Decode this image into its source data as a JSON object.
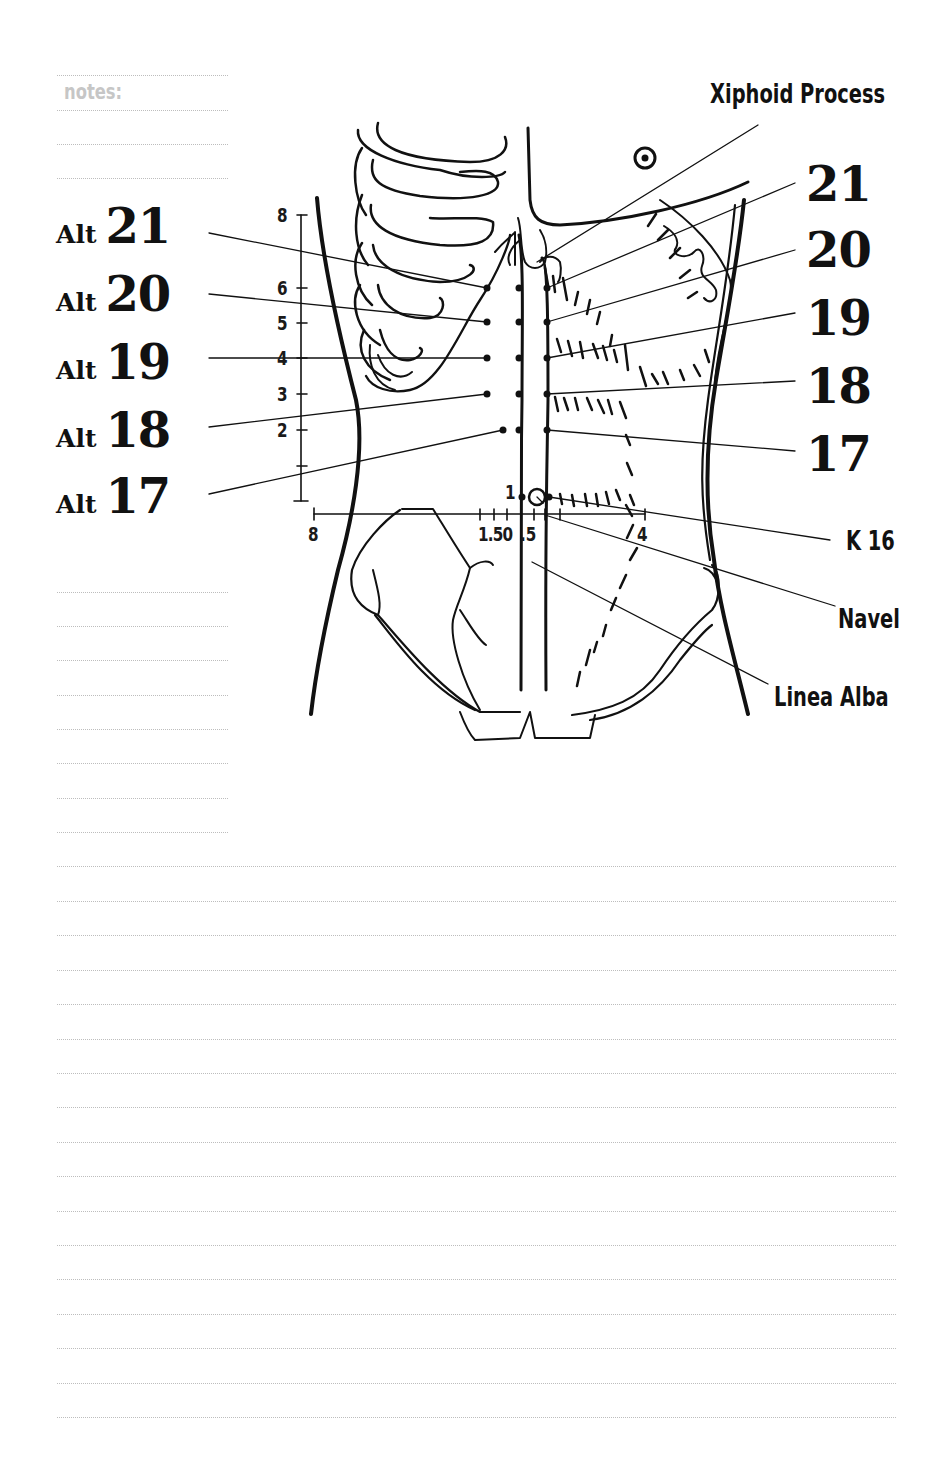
{
  "notes": {
    "label": "notes:",
    "short_rule_count": 13,
    "full_rule_count": 17
  },
  "diagram": {
    "title_annotation": "Xiphoid Process",
    "left_points": [
      {
        "prefix": "Alt",
        "number": "21"
      },
      {
        "prefix": "Alt",
        "number": "20"
      },
      {
        "prefix": "Alt",
        "number": "19"
      },
      {
        "prefix": "Alt",
        "number": "18"
      },
      {
        "prefix": "Alt",
        "number": "17"
      }
    ],
    "right_points": [
      "21",
      "20",
      "19",
      "18",
      "17"
    ],
    "annotations": {
      "k16": "K 16",
      "navel": "Navel",
      "linea_alba": "Linea Alba"
    },
    "vertical_scale": {
      "labels": [
        "8",
        "6",
        "5",
        "4",
        "3",
        "2"
      ]
    },
    "horizontal_scale": {
      "label_left": "8",
      "label_center": "1.50",
      "label_center_b": ".5",
      "label_right": "4",
      "navel_level_label": "1"
    },
    "colors": {
      "ink": "#111111",
      "rule": "#bdbdbd",
      "notes_label": "#c6c6c6"
    }
  }
}
